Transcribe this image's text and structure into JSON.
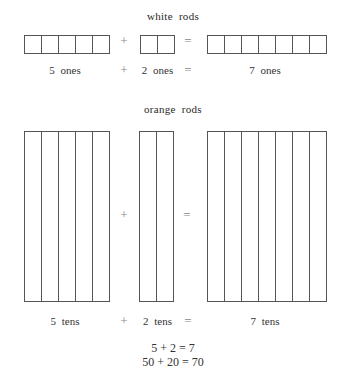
{
  "white": {
    "title": "white rods",
    "groups": [
      5,
      2,
      7
    ],
    "plus": "+",
    "equals": "=",
    "labels": {
      "a": "5  ones",
      "plus": "+",
      "b": "2  ones",
      "equals": "=",
      "c": "7  ones"
    }
  },
  "orange": {
    "title": "orange rods",
    "groups": [
      5,
      2,
      7
    ],
    "plus": "+",
    "equals": "=",
    "labels": {
      "a": "5  tens",
      "plus": "+",
      "b": "2  tens",
      "equals": "=",
      "c": "7  tens"
    }
  },
  "equations": {
    "line1": "5 + 2 = 7",
    "line2": "50 + 20 = 70"
  }
}
